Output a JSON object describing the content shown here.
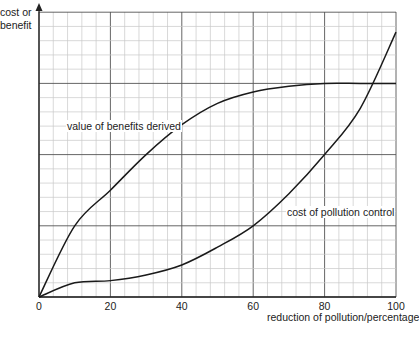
{
  "chart_data": {
    "type": "line",
    "title": "",
    "xlabel": "reduction of pollution/percentage",
    "ylabel": "cost or benefit",
    "xlim": [
      0,
      100
    ],
    "ylim": [
      0,
      4
    ],
    "grid": true,
    "legend": "none (curves labelled directly)",
    "x_ticks": [
      "0",
      "20",
      "40",
      "60",
      "80",
      "100"
    ],
    "y_ticks": [],
    "x": [
      0,
      10,
      20,
      30,
      40,
      50,
      60,
      70,
      80,
      90,
      100
    ],
    "series": [
      {
        "name": "value of benefits derived",
        "values": [
          0,
          1.0,
          1.5,
          2.0,
          2.42,
          2.72,
          2.88,
          2.96,
          3.0,
          3.0,
          3.0
        ]
      },
      {
        "name": "cost of pollution control",
        "values": [
          0,
          0.2,
          0.23,
          0.31,
          0.45,
          0.7,
          1.0,
          1.45,
          2.0,
          2.65,
          3.72
        ]
      }
    ],
    "annotations": [
      {
        "text": "value of benefits derived",
        "near_x": 12,
        "near_y": 2.8
      },
      {
        "text": "cost of pollution control",
        "near_x": 75,
        "near_y": 1.2
      }
    ]
  },
  "labels": {
    "ylabel_line1": "cost or",
    "ylabel_line2": "benefit",
    "xlabel": "reduction of pollution/percentage",
    "ticks": [
      "0",
      "20",
      "40",
      "60",
      "80",
      "100"
    ],
    "benefit_label": "value of benefits derived",
    "cost_label": "cost of pollution control"
  }
}
